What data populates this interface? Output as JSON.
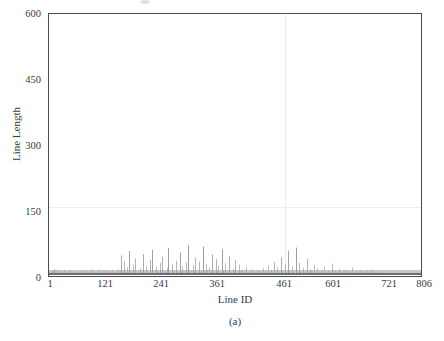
{
  "figure": {
    "subcaption": "(a)",
    "background": "#ffffff",
    "frame_color": "#4a4a4a"
  },
  "chart_data": {
    "type": "bar",
    "title": "",
    "subtitle": "",
    "xlabel": "Line ID",
    "ylabel": "Line Length",
    "xlim": [
      1,
      806
    ],
    "ylim": [
      0,
      600
    ],
    "xticks": [
      1,
      121,
      241,
      361,
      461,
      601,
      721,
      806
    ],
    "xticklabels": [
      "1",
      "121",
      "241",
      "361",
      "461",
      "601",
      "721",
      "806"
    ],
    "yticks": [
      0,
      150,
      300,
      450,
      600
    ],
    "yticklabels": [
      "0",
      "150",
      "300",
      "450",
      "600"
    ],
    "grid": {
      "horizontal_at": [
        150
      ],
      "vertical_at": [
        461
      ],
      "color": "#ededf2"
    },
    "legend": null,
    "series_color": "#8e8e92",
    "series": [
      {
        "name": "Line Length",
        "x_start": 1,
        "x_end": 806,
        "values": [
          2,
          3,
          5,
          2,
          8,
          3,
          2,
          11,
          4,
          3,
          2,
          6,
          14,
          3,
          2,
          4,
          9,
          2,
          3,
          7,
          2,
          12,
          4,
          3,
          2,
          5,
          3,
          2,
          9,
          4,
          3,
          2,
          6,
          3,
          2,
          8,
          3,
          2,
          4,
          10,
          3,
          2,
          5,
          3,
          2,
          7,
          3,
          2,
          4,
          3,
          2,
          9,
          3,
          2,
          5,
          12,
          3,
          2,
          4,
          3,
          2,
          6,
          3,
          2,
          8,
          4,
          3,
          2,
          5,
          3,
          2,
          10,
          3,
          2,
          4,
          3,
          2,
          7,
          3,
          2,
          5,
          3,
          2,
          9,
          4,
          3,
          2,
          6,
          3,
          2,
          4,
          3,
          2,
          11,
          3,
          2,
          5,
          3,
          2,
          8,
          4,
          3,
          2,
          6,
          3,
          2,
          4,
          14,
          3,
          2,
          5,
          3,
          2,
          9,
          3,
          2,
          4,
          3,
          2,
          7,
          3,
          2,
          5,
          3,
          2,
          12,
          4,
          3,
          2,
          6,
          3,
          2,
          4,
          3,
          2,
          8,
          3,
          2,
          5,
          3,
          2,
          10,
          3,
          2,
          4,
          3,
          2,
          6,
          3,
          2,
          9,
          3,
          2,
          5,
          3,
          2,
          4,
          3,
          2,
          7,
          3,
          2,
          11,
          3,
          2,
          5,
          4,
          3,
          2,
          8,
          3,
          2,
          6,
          3,
          2,
          4,
          3,
          2,
          13,
          3,
          2,
          5,
          3,
          2,
          9,
          45,
          4,
          3,
          2,
          7,
          3,
          2,
          5,
          32,
          3,
          2,
          6,
          3,
          2,
          4,
          3,
          2,
          18,
          3,
          2,
          55,
          4,
          3,
          2,
          8,
          3,
          2,
          5,
          3,
          2,
          24,
          3,
          2,
          6,
          4,
          3,
          2,
          38,
          3,
          2,
          5,
          3,
          2,
          9,
          3,
          2,
          4,
          3,
          2,
          16,
          3,
          2,
          7,
          3,
          2,
          5,
          48,
          3,
          2,
          6,
          3,
          2,
          4,
          3,
          2,
          22,
          3,
          2,
          8,
          3,
          2,
          5,
          3,
          2,
          35,
          4,
          3,
          2,
          6,
          3,
          2,
          58,
          3,
          2,
          5,
          3,
          2,
          9,
          3,
          2,
          4,
          19,
          3,
          2,
          7,
          3,
          2,
          5,
          3,
          2,
          28,
          3,
          2,
          6,
          4,
          3,
          2,
          42,
          3,
          2,
          5,
          3,
          2,
          8,
          3,
          2,
          4,
          3,
          2,
          17,
          3,
          2,
          62,
          5,
          3,
          2,
          6,
          3,
          2,
          4,
          3,
          2,
          25,
          3,
          2,
          9,
          3,
          2,
          5,
          3,
          2,
          33,
          4,
          3,
          2,
          7,
          3,
          2,
          5,
          3,
          2,
          52,
          3,
          2,
          6,
          3,
          2,
          4,
          20,
          3,
          2,
          8,
          3,
          2,
          5,
          3,
          2,
          29,
          3,
          2,
          6,
          4,
          3,
          2,
          68,
          3,
          2,
          5,
          3,
          2,
          9,
          3,
          2,
          4,
          3,
          2,
          23,
          3,
          2,
          7,
          3,
          2,
          40,
          5,
          3,
          2,
          6,
          3,
          2,
          4,
          3,
          2,
          31,
          3,
          2,
          8,
          3,
          2,
          5,
          3,
          2,
          65,
          4,
          3,
          2,
          6,
          3,
          2,
          5,
          26,
          3,
          2,
          9,
          3,
          2,
          4,
          3,
          2,
          18,
          3,
          2,
          7,
          3,
          2,
          5,
          47,
          3,
          2,
          6,
          3,
          2,
          4,
          3,
          2,
          36,
          3,
          2,
          8,
          5,
          3,
          2,
          21,
          3,
          2,
          6,
          3,
          2,
          4,
          3,
          2,
          59,
          3,
          2,
          9,
          3,
          2,
          5,
          3,
          2,
          27,
          4,
          3,
          2,
          7,
          3,
          2,
          5,
          3,
          2,
          43,
          3,
          2,
          6,
          3,
          2,
          4,
          3,
          2,
          15,
          3,
          2,
          8,
          3,
          2,
          34,
          5,
          3,
          2,
          6,
          3,
          2,
          4,
          3,
          2,
          24,
          3,
          2,
          9,
          3,
          2,
          5,
          3,
          2,
          12,
          4,
          3,
          2,
          7,
          3,
          2,
          5,
          3,
          2,
          19,
          3,
          2,
          6,
          3,
          2,
          4,
          3,
          2,
          9,
          3,
          2,
          5,
          3,
          2,
          14,
          4,
          3,
          2,
          6,
          3,
          2,
          3,
          2,
          8,
          3,
          2,
          5,
          3,
          2,
          11,
          3,
          2,
          4,
          3,
          2,
          7,
          3,
          2,
          5,
          3,
          2,
          16,
          3,
          2,
          6,
          4,
          3,
          2,
          9,
          3,
          2,
          5,
          3,
          2,
          22,
          3,
          2,
          7,
          3,
          2,
          4,
          3,
          2,
          13,
          3,
          2,
          6,
          3,
          2,
          5,
          30,
          3,
          2,
          8,
          3,
          2,
          4,
          3,
          2,
          18,
          3,
          2,
          6,
          3,
          2,
          5,
          3,
          2,
          41,
          4,
          3,
          2,
          7,
          3,
          2,
          5,
          3,
          2,
          25,
          3,
          2,
          6,
          3,
          2,
          4,
          3,
          2,
          56,
          3,
          2,
          9,
          3,
          2,
          5,
          3,
          2,
          20,
          4,
          3,
          2,
          7,
          3,
          2,
          5,
          3,
          2,
          63,
          3,
          2,
          6,
          3,
          2,
          4,
          3,
          2,
          28,
          3,
          2,
          8,
          3,
          2,
          5,
          3,
          2,
          17,
          4,
          3,
          2,
          6,
          3,
          2,
          5,
          3,
          2,
          37,
          3,
          2,
          7,
          3,
          2,
          4,
          3,
          2,
          12,
          3,
          2,
          9,
          3,
          2,
          5,
          3,
          2,
          23,
          4,
          3,
          2,
          6,
          3,
          2,
          5,
          3,
          2,
          15,
          3,
          2,
          8,
          3,
          2,
          4,
          3,
          2,
          10,
          3,
          2,
          6,
          3,
          2,
          5,
          3,
          2,
          19,
          4,
          3,
          2,
          7,
          3,
          2,
          5,
          3,
          2,
          11,
          3,
          2,
          6,
          3,
          2,
          4,
          3,
          2,
          26,
          3,
          2,
          8,
          3,
          2,
          5,
          3,
          2,
          9,
          4,
          3,
          2,
          6,
          3,
          2,
          5,
          3,
          2,
          14,
          3,
          2,
          7,
          3,
          2,
          4,
          3,
          2,
          8,
          3,
          2,
          5,
          3,
          2,
          12,
          3,
          2,
          6,
          4,
          3,
          2,
          9,
          3,
          2,
          5,
          3,
          2,
          7,
          3,
          2,
          4,
          3,
          2,
          18,
          3,
          2,
          6,
          3,
          2,
          5,
          3,
          2,
          8,
          4,
          3,
          2,
          5,
          3,
          2,
          4,
          3,
          2,
          11,
          3,
          2,
          6,
          3,
          2,
          4,
          3,
          2,
          7,
          3,
          2,
          5,
          3,
          2,
          9,
          4,
          3,
          2,
          5,
          3,
          2,
          4,
          3,
          2,
          6,
          3,
          2,
          5,
          3,
          2,
          13,
          3,
          2,
          4,
          3,
          2,
          6,
          3,
          2,
          5,
          3,
          2,
          8,
          3,
          2,
          4,
          2,
          3,
          5,
          2,
          3,
          4,
          2,
          6,
          3,
          2,
          4,
          2,
          3,
          5,
          2,
          3,
          2,
          4,
          2,
          3,
          2,
          5,
          3,
          2,
          4,
          2,
          3,
          2,
          4,
          2,
          3,
          2,
          5,
          2,
          3,
          2,
          4,
          2,
          3,
          2,
          3,
          2,
          4,
          2,
          3,
          2,
          2,
          3,
          2,
          2,
          3,
          2,
          2,
          3,
          2,
          2,
          2,
          3,
          2,
          2,
          2,
          3,
          2,
          2,
          2,
          2,
          3,
          2,
          2,
          2,
          2,
          2,
          3,
          2,
          2,
          2,
          2,
          2,
          2,
          2,
          1,
          2,
          2,
          1,
          2,
          2,
          1,
          2,
          1,
          2,
          1,
          2,
          1,
          1,
          2,
          1,
          1,
          1,
          2,
          1,
          1,
          1,
          1,
          1,
          1,
          1,
          1,
          1,
          1
        ]
      }
    ]
  },
  "axis": {
    "y_title": "Line Length",
    "x_title": "Line ID"
  }
}
